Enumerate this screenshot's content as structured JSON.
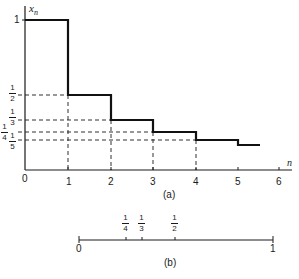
{
  "figure_a": {
    "caption": "(a)",
    "y_axis_label": "x",
    "y_axis_subscript": "n",
    "x_axis_label": "n",
    "x_ticks": [
      "0",
      "1",
      "2",
      "3",
      "4",
      "5",
      "6"
    ],
    "y_tick_one": "1",
    "y_fracs": [
      {
        "num": "1",
        "den": "2"
      },
      {
        "num": "1",
        "den": "3"
      },
      {
        "num": "1",
        "den": "4"
      },
      {
        "num": "1",
        "den": "5"
      }
    ],
    "step_values": [
      1,
      0.5,
      0.3333,
      0.25,
      0.2,
      0.1667
    ]
  },
  "figure_b": {
    "caption": "(b)",
    "left_label": "0",
    "right_label": "1",
    "marks": [
      {
        "num": "1",
        "den": "4"
      },
      {
        "num": "1",
        "den": "3"
      },
      {
        "num": "1",
        "den": "2"
      }
    ]
  }
}
